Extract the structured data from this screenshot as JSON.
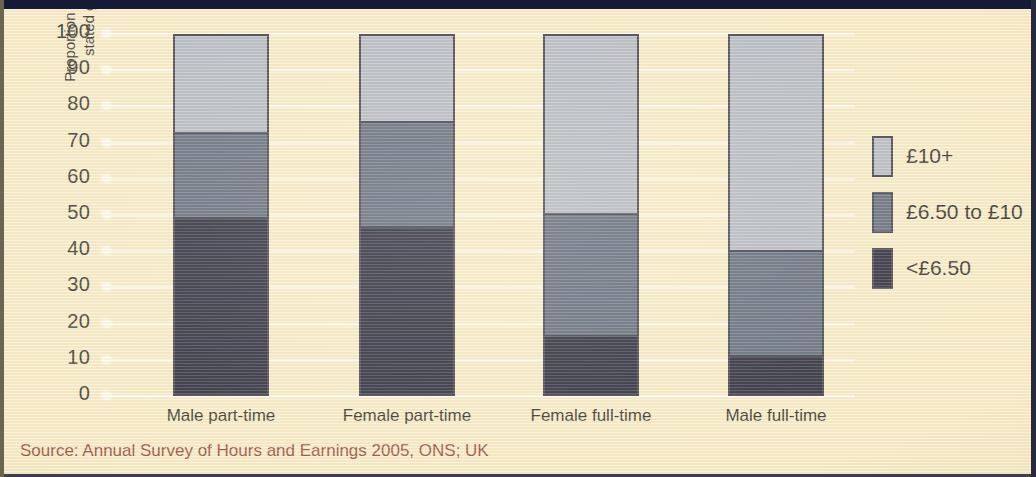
{
  "chart_data": {
    "type": "bar",
    "subtype": "stacked-bar-100",
    "title": "",
    "xlabel": "",
    "ylabel": "Proportion of employees in the stated group (per cent)",
    "ylim": [
      0,
      100
    ],
    "ytick_labels": [
      "100",
      "90",
      "80",
      "70",
      "60",
      "50",
      "40",
      "30",
      "20",
      "10",
      "0"
    ],
    "yticks": [
      100,
      90,
      80,
      70,
      60,
      50,
      40,
      30,
      20,
      10,
      0
    ],
    "grid": true,
    "grid_axis": "y",
    "legend_position": "right",
    "categories": [
      "Male part-time",
      "Female part-time",
      "Female full-time",
      "Male full-time"
    ],
    "series": [
      {
        "name": "<£6.50",
        "color": "#12152e",
        "values": [
          50.0,
          47.5,
          17.5,
          12.0
        ]
      },
      {
        "name": "£6.50 to £10",
        "color": "#515e77",
        "values": [
          23.5,
          29.0,
          33.5,
          29.0
        ]
      },
      {
        "name": "£10+",
        "color": "#aeb6c5",
        "values": [
          26.5,
          23.5,
          49.0,
          59.0
        ]
      }
    ],
    "source": "Source: Annual Survey of Hours and Earnings 2005, ONS; UK"
  },
  "legend": {
    "items": [
      {
        "label": "£10+",
        "color": "#aeb6c5"
      },
      {
        "label": "£6.50 to £10",
        "color": "#515e77"
      },
      {
        "label": "<£6.50",
        "color": "#12152e"
      }
    ]
  },
  "colors": {
    "background": "#f8edca",
    "high_band": "#aeb6c5",
    "mid_band": "#515e77",
    "low_band": "#12152e",
    "outline": "#2b2f40",
    "source_text": "#8d3a34",
    "gridline": "#ffffff",
    "edge_dark": "#151a36"
  },
  "source_note": "Source: Annual Survey of Hours and Earnings 2005, ONS; UK"
}
